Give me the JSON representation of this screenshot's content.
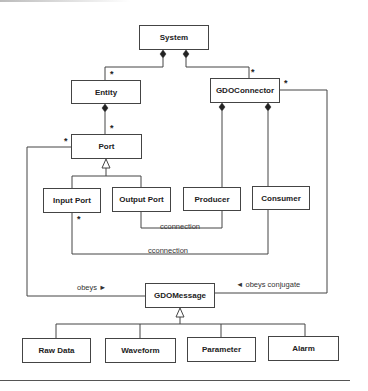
{
  "diagram": {
    "type": "uml-class-diagram",
    "classes": {
      "system": "System",
      "entity": "Entity",
      "gdo_connector": "GDOConnector",
      "port": "Port",
      "input_port": "Input Port",
      "output_port": "Output Port",
      "producer": "Producer",
      "consumer": "Consumer",
      "gdo_message": "GDOMessage",
      "raw_data": "Raw Data",
      "waveform": "Waveform",
      "parameter": "Parameter",
      "alarm": "Alarm"
    },
    "labels": {
      "cconnection_1": "cconnection",
      "cconnection_2": "cconnection",
      "obeys": "obeys ►",
      "obeys_conjugate": "◄ obeys conjugate"
    },
    "multiplicities": {
      "entity_top": "*",
      "gdoconnector_top": "*",
      "gdoconnector_right": "*",
      "port_top": "*",
      "port_left": "*",
      "input_port_bottom": "*"
    },
    "relationships": [
      {
        "from": "System",
        "to": "Entity",
        "kind": "composition",
        "multiplicity": "*"
      },
      {
        "from": "System",
        "to": "GDOConnector",
        "kind": "composition",
        "multiplicity": "*"
      },
      {
        "from": "Entity",
        "to": "Port",
        "kind": "composition",
        "multiplicity": "*"
      },
      {
        "from": "GDOConnector",
        "to": "Producer",
        "kind": "composition"
      },
      {
        "from": "GDOConnector",
        "to": "Consumer",
        "kind": "composition"
      },
      {
        "from": "Input Port",
        "to": "Port",
        "kind": "generalization"
      },
      {
        "from": "Output Port",
        "to": "Port",
        "kind": "generalization"
      },
      {
        "from": "Output Port",
        "to": "Producer",
        "kind": "association",
        "label": "cconnection"
      },
      {
        "from": "Input Port",
        "to": "Consumer",
        "kind": "association",
        "label": "cconnection",
        "multiplicity": "*"
      },
      {
        "from": "Port",
        "to": "GDOMessage",
        "kind": "association",
        "label": "obeys"
      },
      {
        "from": "GDOConnector",
        "to": "GDOMessage",
        "kind": "association",
        "label": "obeys conjugate"
      },
      {
        "from": "Raw Data",
        "to": "GDOMessage",
        "kind": "generalization"
      },
      {
        "from": "Waveform",
        "to": "GDOMessage",
        "kind": "generalization"
      },
      {
        "from": "Parameter",
        "to": "GDOMessage",
        "kind": "generalization"
      },
      {
        "from": "Alarm",
        "to": "GDOMessage",
        "kind": "generalization"
      }
    ]
  }
}
